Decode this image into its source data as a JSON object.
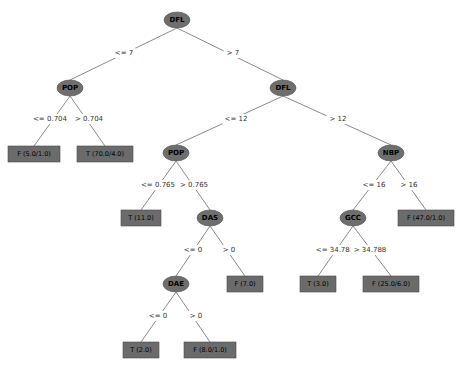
{
  "diagram": {
    "type": "decision-tree",
    "nodes": [
      {
        "id": "n0",
        "label": "DFL",
        "kind": "split",
        "x": 177,
        "y": 20
      },
      {
        "id": "n1",
        "label": "POP",
        "kind": "split",
        "x": 70,
        "y": 88
      },
      {
        "id": "n2",
        "label": "DFL",
        "kind": "split",
        "x": 283,
        "y": 88
      },
      {
        "id": "n3",
        "label": "F (5.0/1.0)",
        "kind": "leaf",
        "x": 34,
        "y": 154
      },
      {
        "id": "n4",
        "label": "T (70.0/4.0)",
        "kind": "leaf",
        "x": 105,
        "y": 154
      },
      {
        "id": "n5",
        "label": "POP",
        "kind": "split",
        "x": 176,
        "y": 153
      },
      {
        "id": "n6",
        "label": "NBP",
        "kind": "split",
        "x": 391,
        "y": 153
      },
      {
        "id": "n7",
        "label": "T (11.0)",
        "kind": "leaf",
        "x": 141,
        "y": 218
      },
      {
        "id": "n8",
        "label": "DAS",
        "kind": "split",
        "x": 210,
        "y": 218
      },
      {
        "id": "n9",
        "label": "GCC",
        "kind": "split",
        "x": 353,
        "y": 218
      },
      {
        "id": "n10",
        "label": "F (47.0/1.0)",
        "kind": "leaf",
        "x": 426,
        "y": 218
      },
      {
        "id": "n11",
        "label": "DAE",
        "kind": "split",
        "x": 176,
        "y": 284
      },
      {
        "id": "n12",
        "label": "F (7.0)",
        "kind": "leaf",
        "x": 245,
        "y": 284
      },
      {
        "id": "n13",
        "label": "T (3.0)",
        "kind": "leaf",
        "x": 318,
        "y": 284
      },
      {
        "id": "n14",
        "label": "F (25.0/6.0)",
        "kind": "leaf",
        "x": 391,
        "y": 284
      },
      {
        "id": "n15",
        "label": "T (2.0)",
        "kind": "leaf",
        "x": 141,
        "y": 350
      },
      {
        "id": "n16",
        "label": "F (8.0/1.0)",
        "kind": "leaf",
        "x": 210,
        "y": 350
      }
    ],
    "edges": [
      {
        "from": "n0",
        "to": "n1",
        "label": "<= 7",
        "lx": 124,
        "ly": 53
      },
      {
        "from": "n0",
        "to": "n2",
        "label": "> 7",
        "lx": 233,
        "ly": 53
      },
      {
        "from": "n1",
        "to": "n3",
        "label": "<= 0.704",
        "lx": 50,
        "ly": 119
      },
      {
        "from": "n1",
        "to": "n4",
        "label": "> 0.704",
        "lx": 89,
        "ly": 119
      },
      {
        "from": "n2",
        "to": "n5",
        "label": "<= 12",
        "lx": 236,
        "ly": 119
      },
      {
        "from": "n2",
        "to": "n6",
        "label": "> 12",
        "lx": 338,
        "ly": 119
      },
      {
        "from": "n5",
        "to": "n7",
        "label": "<= 0.765",
        "lx": 158,
        "ly": 185
      },
      {
        "from": "n5",
        "to": "n8",
        "label": "> 0.765",
        "lx": 194,
        "ly": 185
      },
      {
        "from": "n6",
        "to": "n9",
        "label": "<= 16",
        "lx": 374,
        "ly": 185
      },
      {
        "from": "n6",
        "to": "n10",
        "label": "> 16",
        "lx": 409,
        "ly": 185
      },
      {
        "from": "n8",
        "to": "n11",
        "label": "<= 0",
        "lx": 193,
        "ly": 250
      },
      {
        "from": "n8",
        "to": "n12",
        "label": "> 0",
        "lx": 229,
        "ly": 250
      },
      {
        "from": "n9",
        "to": "n13",
        "label": "<= 34.788",
        "lx": 335,
        "ly": 250
      },
      {
        "from": "n9",
        "to": "n14",
        "label": "> 34.788",
        "lx": 370,
        "ly": 250
      },
      {
        "from": "n11",
        "to": "n15",
        "label": "<= 0",
        "lx": 158,
        "ly": 316
      },
      {
        "from": "n11",
        "to": "n16",
        "label": "> 0",
        "lx": 196,
        "ly": 316
      }
    ]
  }
}
